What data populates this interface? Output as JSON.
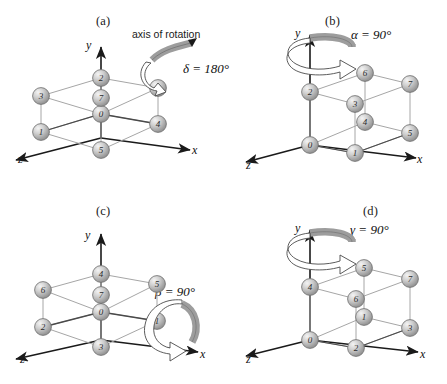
{
  "figure": {
    "background_color": "#ffffff",
    "sphere_color": "#b9b9b9",
    "sphere_highlight_color": "#efefef",
    "sphere_edge_color": "#6d6d6d",
    "edge_color": "#9a9a9a",
    "front_edge_color": "#3a3a3a",
    "axis_color": "#1a1a1a",
    "arrow_fill_color": "#b0b0b0",
    "arrow_outline_color": "#4a4a4a"
  },
  "axes": {
    "x_label": "x",
    "y_label": "y",
    "z_label": "z"
  },
  "panels": [
    {
      "id": "a",
      "caption": "(a)",
      "angle_label": "δ = 180°",
      "axis_note": "axis of rotation",
      "rotation_symbol": "δ",
      "rotation_degrees": "180°",
      "vertices": [
        {
          "label": "2",
          "position": "top-back-center"
        },
        {
          "label": "3",
          "position": "top-left"
        },
        {
          "label": "6",
          "position": "top-right"
        },
        {
          "label": "7",
          "position": "top-front-center"
        },
        {
          "label": "0",
          "position": "bottom-back-center"
        },
        {
          "label": "1",
          "position": "bottom-left"
        },
        {
          "label": "4",
          "position": "bottom-right"
        },
        {
          "label": "5",
          "position": "bottom-front-center"
        }
      ]
    },
    {
      "id": "b",
      "caption": "(b)",
      "angle_label": "α = 90°",
      "axis_note": "",
      "rotation_symbol": "α",
      "rotation_degrees": "90°",
      "vertices": [
        {
          "label": "2",
          "position": "top-left"
        },
        {
          "label": "6",
          "position": "top-back-center"
        },
        {
          "label": "7",
          "position": "top-right"
        },
        {
          "label": "3",
          "position": "top-front-center"
        },
        {
          "label": "0",
          "position": "bottom-left"
        },
        {
          "label": "4",
          "position": "bottom-back-center"
        },
        {
          "label": "5",
          "position": "bottom-right"
        },
        {
          "label": "1",
          "position": "bottom-front-center"
        }
      ]
    },
    {
      "id": "c",
      "caption": "(c)",
      "angle_label": "β = 90°",
      "axis_note": "",
      "rotation_symbol": "β",
      "rotation_degrees": "90°",
      "vertices": [
        {
          "label": "4",
          "position": "top-back-center"
        },
        {
          "label": "6",
          "position": "top-left"
        },
        {
          "label": "5",
          "position": "top-right"
        },
        {
          "label": "7",
          "position": "top-front-center"
        },
        {
          "label": "0",
          "position": "bottom-back-center"
        },
        {
          "label": "2",
          "position": "bottom-left"
        },
        {
          "label": "1",
          "position": "bottom-right"
        },
        {
          "label": "3",
          "position": "bottom-front-center"
        }
      ]
    },
    {
      "id": "d",
      "caption": "(d)",
      "angle_label": "γ = 90°",
      "axis_note": "",
      "rotation_symbol": "γ",
      "rotation_degrees": "90°",
      "vertices": [
        {
          "label": "4",
          "position": "top-left"
        },
        {
          "label": "5",
          "position": "top-back-center"
        },
        {
          "label": "7",
          "position": "top-right"
        },
        {
          "label": "6",
          "position": "top-front-center"
        },
        {
          "label": "0",
          "position": "bottom-left"
        },
        {
          "label": "1",
          "position": "bottom-back-center"
        },
        {
          "label": "3",
          "position": "bottom-right"
        },
        {
          "label": "2",
          "position": "bottom-front-center"
        }
      ]
    }
  ]
}
